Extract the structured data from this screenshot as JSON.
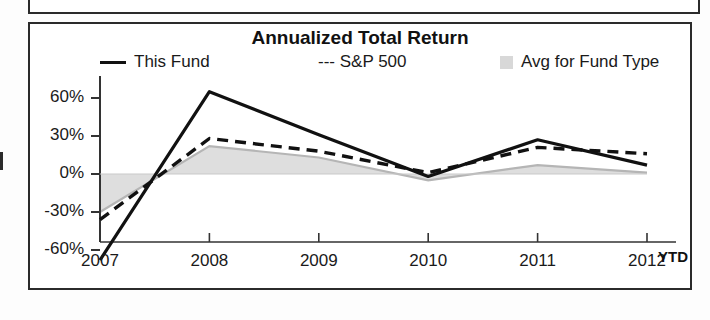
{
  "chart_data": {
    "type": "line",
    "title": "Annualized Total Return",
    "xlabel": "",
    "ylabel": "",
    "x": [
      "2007",
      "2008",
      "2009",
      "2010",
      "2011",
      "2012"
    ],
    "x_tick_labels": [
      "2007",
      "2008",
      "2009",
      "2010",
      "2011",
      "2012"
    ],
    "x_axis_note": "YTD",
    "y_tick_labels": [
      "60%",
      "30%",
      "0%",
      "-30%",
      "-60%"
    ],
    "y_tick_values": [
      60,
      30,
      0,
      -30,
      -60
    ],
    "ylim": [
      -72,
      72
    ],
    "grid": false,
    "legend_position": "top",
    "series": [
      {
        "name": "This Fund",
        "style": "solid",
        "color": "#111111",
        "values": [
          -68,
          65,
          31,
          -2,
          27,
          7
        ]
      },
      {
        "name": "S&P 500",
        "style": "dashed",
        "color": "#111111",
        "values": [
          -36,
          28,
          18,
          1,
          21,
          16
        ]
      },
      {
        "name": "Avg for Fund Type",
        "style": "area",
        "color": "#d8d8d8",
        "values": [
          -30,
          22,
          13,
          -5,
          7,
          1
        ]
      }
    ]
  },
  "chart": {
    "title": "Annualized Total Return",
    "legend": {
      "this_fund": "This Fund",
      "sp500": "--- S&P 500",
      "avg_fund_type": "Avg for Fund Type"
    },
    "y_axis": {
      "t0": "60%",
      "t1": "30%",
      "t2": "0%",
      "t3": "-30%",
      "t4": "-60%"
    },
    "x_axis": {
      "t0": "2007",
      "t1": "2008",
      "t2": "2009",
      "t3": "2010",
      "t4": "2011",
      "t5": "2012",
      "ytd": "YTD"
    }
  }
}
